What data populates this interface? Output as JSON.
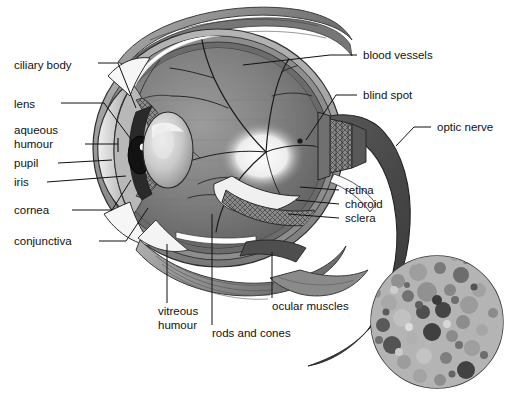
{
  "diagram": {
    "background_color": "#ffffff",
    "ink_color": "#111111",
    "label_font_size_px": 11.5,
    "labels_left": [
      {
        "id": "ciliary-body",
        "text": "ciliary body",
        "x": 14,
        "y": 69,
        "anchor_x": 98,
        "anchor_y": 63,
        "target_x": 136,
        "target_y": 108
      },
      {
        "id": "lens",
        "text": "lens",
        "x": 14,
        "y": 108,
        "anchor_x": 61,
        "anchor_y": 103,
        "target_x": 133,
        "target_y": 142
      },
      {
        "id": "aqueous-humour",
        "text": "aqueous",
        "text2": "humour",
        "x": 14,
        "y": 134,
        "x2": 14,
        "y2": 148,
        "anchor_x": 85,
        "anchor_y": 144,
        "target_x": 112,
        "target_y": 144
      },
      {
        "id": "pupil",
        "text": "pupil",
        "x": 14,
        "y": 167,
        "anchor_x": 58,
        "anchor_y": 163,
        "target_x": 108,
        "target_y": 156
      },
      {
        "id": "iris",
        "text": "iris",
        "x": 14,
        "y": 186,
        "anchor_x": 47,
        "anchor_y": 182,
        "target_x": 122,
        "target_y": 176
      },
      {
        "id": "cornea",
        "text": "cornea",
        "x": 14,
        "y": 214,
        "anchor_x": 72,
        "anchor_y": 210,
        "target_x": 131,
        "target_y": 180
      },
      {
        "id": "conjunctiva",
        "text": "conjunctiva",
        "x": 14,
        "y": 245,
        "anchor_x": 99,
        "anchor_y": 241,
        "target_x": 146,
        "target_y": 206
      }
    ],
    "labels_right": [
      {
        "id": "blood-vessels",
        "text": "blood vessels",
        "x": 363,
        "y": 59,
        "anchor_x": 357,
        "anchor_y": 55,
        "target_x": 243,
        "target_y": 65
      },
      {
        "id": "blind-spot",
        "text": "blind spot",
        "x": 363,
        "y": 99,
        "anchor_x": 357,
        "anchor_y": 95,
        "target_x": 305,
        "target_y": 140
      },
      {
        "id": "optic-nerve",
        "text": "optic nerve",
        "x": 437,
        "y": 131,
        "anchor_x": 431,
        "anchor_y": 127,
        "target_x": 399,
        "target_y": 145
      },
      {
        "id": "retina",
        "text": "retina",
        "x": 345,
        "y": 194,
        "anchor_x": 339,
        "anchor_y": 190,
        "target_x": 300,
        "target_y": 186
      },
      {
        "id": "choroid",
        "text": "choroid",
        "x": 345,
        "y": 208,
        "anchor_x": 339,
        "anchor_y": 204,
        "target_x": 296,
        "target_y": 199
      },
      {
        "id": "sclera",
        "text": "sclera",
        "x": 345,
        "y": 222,
        "anchor_x": 339,
        "anchor_y": 218,
        "target_x": 290,
        "target_y": 214
      }
    ],
    "labels_bottom": [
      {
        "id": "vitreous-humour",
        "text": "vitreous",
        "text2": "humour",
        "x": 158,
        "y": 315,
        "x2": 158,
        "y2": 329,
        "anchor_x": 167,
        "anchor_y": 303,
        "target_x": 167,
        "target_y": 244
      },
      {
        "id": "rods-and-cones",
        "text": "rods and cones",
        "x": 212,
        "y": 337,
        "anchor_x": 212,
        "anchor_y": 325,
        "target_x": 212,
        "target_y": 214
      },
      {
        "id": "ocular-muscles",
        "text": "ocular muscles",
        "x": 272,
        "y": 310,
        "anchor_x": 272,
        "anchor_y": 298,
        "target_x": 272,
        "target_y": 252
      }
    ],
    "inset": {
      "id": "rods-and-cones-inset",
      "center_x": 437,
      "center_y": 322,
      "radius": 66,
      "description": "photoreceptor mosaic of rods and cones",
      "fill": "#b9b9b9",
      "stroke": "#3a3a3a"
    },
    "structures": [
      {
        "id": "sclera-outer",
        "fill": "#9a9a9a"
      },
      {
        "id": "choroid-layer",
        "fill": "#6e6e6e"
      },
      {
        "id": "retina-layer",
        "fill": "#8b8b8b"
      },
      {
        "id": "vitreous-body",
        "fill": "#7a7a7a"
      },
      {
        "id": "cornea-dome",
        "fill": "#c8c8c8"
      },
      {
        "id": "lens-body",
        "fill": "#d4d4d4"
      },
      {
        "id": "pupil-aperture",
        "fill": "#141414"
      },
      {
        "id": "optic-nerve-trunk",
        "fill": "#4a4a4a"
      },
      {
        "id": "ocular-muscle-bands",
        "fill": "#8f8f8f"
      },
      {
        "id": "conjunctiva-flap",
        "fill": "#f2f2f2"
      },
      {
        "id": "blind-spot-glow",
        "fill": "#f5f5f5"
      }
    ]
  }
}
